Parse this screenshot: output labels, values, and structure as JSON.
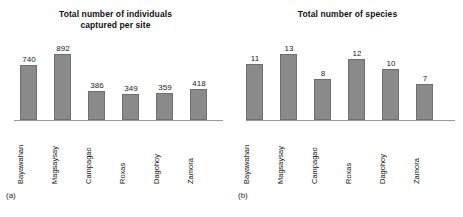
{
  "figure": {
    "background_color": "#ffffff",
    "bar_fill_color": "#8a8a8a",
    "bar_edge_color": "#6f6f6f",
    "axis_color": "#9a9a9a",
    "text_color": "#1a1a1a"
  },
  "panels": [
    {
      "letter": "(a)",
      "chart_data": {
        "type": "bar",
        "title": "Total number of individuals captured per site",
        "title_lines": [
          "Total number of individuals",
          "captured per site"
        ],
        "xlabel": "",
        "ylabel": "",
        "categories": [
          "Bayawahan",
          "Magsaysay",
          "Campagao",
          "Roxas",
          "Dagohoy",
          "Zamora"
        ],
        "values": [
          740,
          892,
          386,
          349,
          359,
          418
        ],
        "value_labels": [
          "740",
          "892",
          "386",
          "349",
          "359",
          "418"
        ],
        "ylim": [
          0,
          1000
        ],
        "grid": false,
        "legend": false,
        "axis_visible": [
          "x"
        ],
        "tick_labels_rotation": -90
      }
    },
    {
      "letter": "(b)",
      "chart_data": {
        "type": "bar",
        "title": "Total number of species",
        "title_lines": [
          "Total number of species"
        ],
        "xlabel": "",
        "ylabel": "",
        "categories": [
          "Bayawahan",
          "Magsaysay",
          "Campagao",
          "Roxas",
          "Dagohoy",
          "Zamora"
        ],
        "values": [
          11,
          13,
          8,
          12,
          10,
          7
        ],
        "value_labels": [
          "11",
          "13",
          "8",
          "12",
          "10",
          "7"
        ],
        "ylim": [
          0,
          14.5
        ],
        "grid": false,
        "legend": false,
        "axis_visible": [
          "x"
        ],
        "tick_labels_rotation": -90
      }
    }
  ]
}
